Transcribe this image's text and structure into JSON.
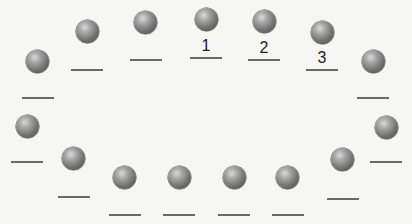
{
  "diagram": {
    "colors": {
      "background": "#f6f6f4",
      "ball": "#7a7a7a",
      "line": "#6a6a6a",
      "label": "#222222"
    },
    "items": [
      {
        "id": 1,
        "ball": [
          37,
          61
        ],
        "line": [
          22,
          97
        ],
        "label": ""
      },
      {
        "id": 2,
        "ball": [
          87,
          31
        ],
        "line": [
          71,
          69
        ],
        "label": ""
      },
      {
        "id": 3,
        "ball": [
          145,
          22
        ],
        "line": [
          130,
          59
        ],
        "label": ""
      },
      {
        "id": 4,
        "ball": [
          206,
          19
        ],
        "line": [
          190,
          57
        ],
        "label": "1"
      },
      {
        "id": 5,
        "ball": [
          264,
          21
        ],
        "line": [
          248,
          59
        ],
        "label": "2"
      },
      {
        "id": 6,
        "ball": [
          322,
          32
        ],
        "line": [
          306,
          69
        ],
        "label": "3"
      },
      {
        "id": 7,
        "ball": [
          373,
          61
        ],
        "line": [
          357,
          97
        ],
        "label": ""
      },
      {
        "id": 8,
        "ball": [
          386,
          127
        ],
        "line": [
          370,
          161
        ],
        "label": ""
      },
      {
        "id": 9,
        "ball": [
          342,
          159
        ],
        "line": [
          327,
          198
        ],
        "label": ""
      },
      {
        "id": 10,
        "ball": [
          287,
          177
        ],
        "line": [
          272,
          214
        ],
        "label": ""
      },
      {
        "id": 11,
        "ball": [
          234,
          177
        ],
        "line": [
          218,
          214
        ],
        "label": ""
      },
      {
        "id": 12,
        "ball": [
          179,
          177
        ],
        "line": [
          163,
          214
        ],
        "label": ""
      },
      {
        "id": 13,
        "ball": [
          124,
          177
        ],
        "line": [
          109,
          214
        ],
        "label": ""
      },
      {
        "id": 14,
        "ball": [
          73,
          158
        ],
        "line": [
          58,
          196
        ],
        "label": ""
      },
      {
        "id": 15,
        "ball": [
          27,
          126
        ],
        "line": [
          11,
          161
        ],
        "label": ""
      }
    ]
  }
}
